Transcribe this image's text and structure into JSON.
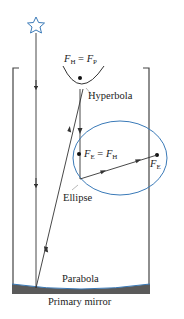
{
  "diagram": {
    "type": "telescope-optics-schematic",
    "colors": {
      "line": "#333333",
      "accent_blue": "#3a7ab8",
      "mirror_fill": "#5a5a5a"
    },
    "labels": {
      "hyperbola_focus": {
        "F": "F",
        "sub_left": "H",
        "eq": " = ",
        "F2": "F",
        "sub_right": "P"
      },
      "hyperbola": "Hyperbola",
      "ellipse_near_focus": {
        "F": "F",
        "sub_left": "E",
        "eq": " = ",
        "F2": "F",
        "sub_right": "H"
      },
      "ellipse_far_focus": {
        "F": "F",
        "sub": "E"
      },
      "ellipse": "Ellipse",
      "parabola": "Parabola",
      "primary_mirror": "Primary mirror"
    },
    "icons": [
      "star-icon"
    ]
  }
}
